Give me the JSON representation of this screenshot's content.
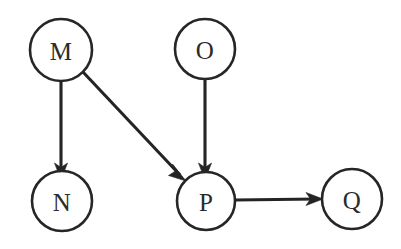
{
  "diagram": {
    "type": "directed-graph",
    "background_color": "#ffffff",
    "node_fill": "#ffffff",
    "node_stroke": "#262626",
    "edge_color": "#242424",
    "label_color": "#2b2b2b",
    "width": 401,
    "height": 249,
    "nodes": [
      {
        "id": "M",
        "label": "M",
        "cx": 61,
        "cy": 50,
        "r": 31
      },
      {
        "id": "O",
        "label": "O",
        "cx": 205,
        "cy": 49,
        "r": 30
      },
      {
        "id": "N",
        "label": "N",
        "cx": 62,
        "cy": 201,
        "r": 30
      },
      {
        "id": "P",
        "label": "P",
        "cx": 206,
        "cy": 201,
        "r": 29
      },
      {
        "id": "Q",
        "label": "Q",
        "cx": 352,
        "cy": 199,
        "r": 30
      }
    ],
    "edges": [
      {
        "id": "M-N",
        "from": "M",
        "to": "N",
        "label": "",
        "x1": 61,
        "y1": 81,
        "x2": 61,
        "y2": 171,
        "direction": "down"
      },
      {
        "id": "M-P",
        "from": "M",
        "to": "P",
        "label": "",
        "x1": 83,
        "y1": 72,
        "x2": 185,
        "y2": 180,
        "direction": "down-right"
      },
      {
        "id": "O-P",
        "from": "O",
        "to": "P",
        "label": "",
        "x1": 205,
        "y1": 79,
        "x2": 205,
        "y2": 171,
        "direction": "down"
      },
      {
        "id": "P-Q",
        "from": "P",
        "to": "Q",
        "label": "",
        "x1": 235,
        "y1": 200,
        "x2": 322,
        "y2": 199,
        "direction": "right"
      }
    ]
  }
}
